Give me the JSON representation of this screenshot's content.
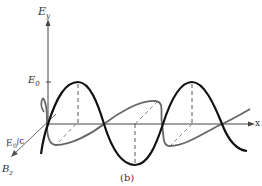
{
  "figure": {
    "caption": "(b)",
    "axes": {
      "vertical_label": "E",
      "vertical_sub": "y",
      "horizontal_label": "x",
      "depth_label": "B",
      "depth_sub": "z"
    },
    "amplitude_labels": {
      "electric": "E",
      "electric_sub": "0",
      "magnetic": "E",
      "magnetic_sub": "0",
      "magnetic_suffix": "/c"
    },
    "colors": {
      "electric_wave": "#111111",
      "magnetic_wave": "#666666",
      "axes": "#444444"
    }
  }
}
